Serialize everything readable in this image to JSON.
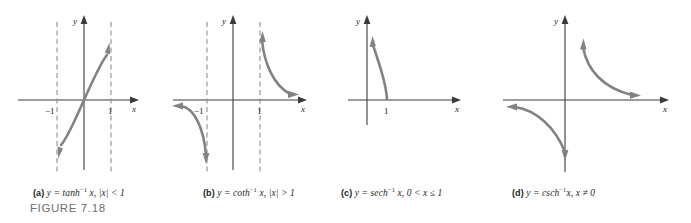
{
  "figure": {
    "label": "FIGURE 7.18",
    "background": "#ffffff",
    "curve_color": "#808285",
    "axis_color": "#3b3b3b",
    "asymptote_color": "#808285",
    "text_color": "#231f20",
    "fig_label_color": "#6d6e71"
  },
  "panels": [
    {
      "key": "a",
      "caption_letter": "(a)",
      "caption_eq_lhs": "y = tanh",
      "caption_exp": "−1",
      "caption_eq_rhs": " x, |x| < 1",
      "axis_y_label": "y",
      "axis_x_label": "x",
      "tick_labels": [
        "−1",
        "1"
      ],
      "asymptotes": [
        "x = −1",
        "x = 1"
      ],
      "function": "arctanh",
      "domain": "|x| < 1",
      "range": "all reals"
    },
    {
      "key": "b",
      "caption_letter": "(b)",
      "caption_eq_lhs": "y = coth",
      "caption_exp": "−1",
      "caption_eq_rhs": " x, |x| > 1",
      "axis_y_label": "y",
      "axis_x_label": "x",
      "tick_labels": [
        "−1",
        "1"
      ],
      "asymptotes": [
        "x = −1",
        "x = 1"
      ],
      "function": "arccoth",
      "domain": "|x| > 1",
      "range": "y ≠ 0"
    },
    {
      "key": "c",
      "caption_letter": "(c)",
      "caption_eq_lhs": "y = sech",
      "caption_exp": "−1",
      "caption_eq_rhs": " x, 0 < x ≤ 1",
      "axis_y_label": "y",
      "axis_x_label": "x",
      "tick_labels": [
        "1"
      ],
      "asymptotes": [
        "x = 0"
      ],
      "function": "arcsech",
      "domain": "0 < x ≤ 1",
      "range": "y ≥ 0"
    },
    {
      "key": "d",
      "caption_letter": "(d)",
      "caption_eq_lhs": "y = csch",
      "caption_exp": "−1",
      "caption_eq_rhs": "x, x ≠ 0",
      "axis_y_label": "y",
      "axis_x_label": "x",
      "tick_labels": [],
      "asymptotes": [
        "x = 0",
        "y = 0"
      ],
      "function": "arccsch",
      "domain": "x ≠ 0",
      "range": "y ≠ 0"
    }
  ]
}
